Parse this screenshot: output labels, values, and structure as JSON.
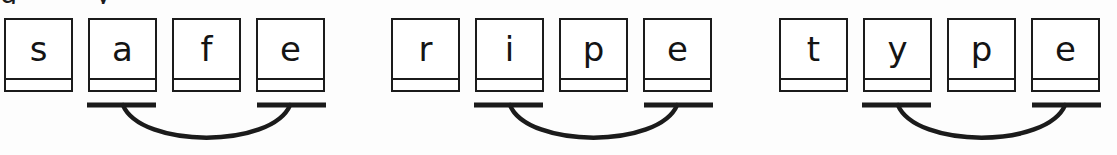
{
  "page": {
    "width": 1117,
    "height": 155,
    "ink_color": "#1b1b1b",
    "paper_color": "#fdfdfd",
    "cutoff_text_above": "g    y"
  },
  "words": [
    {
      "word": "safe",
      "x": 4,
      "letters": [
        {
          "char": "s",
          "x": 0,
          "marked": false
        },
        {
          "char": "a",
          "x": 84,
          "marked": true
        },
        {
          "char": "f",
          "x": 168,
          "marked": false
        },
        {
          "char": "e",
          "x": 252,
          "marked": true
        }
      ],
      "arc": {
        "start_x": 83,
        "end_x": 322,
        "bar_length": 69,
        "depth": 30
      }
    },
    {
      "word": "ripe",
      "x": 391,
      "letters": [
        {
          "char": "r",
          "x": 0,
          "marked": false
        },
        {
          "char": "i",
          "x": 84,
          "marked": true
        },
        {
          "char": "p",
          "x": 168,
          "marked": false
        },
        {
          "char": "e",
          "x": 252,
          "marked": true
        }
      ],
      "arc": {
        "start_x": 83,
        "end_x": 322,
        "bar_length": 69,
        "depth": 30
      }
    },
    {
      "word": "type",
      "x": 779,
      "letters": [
        {
          "char": "t",
          "x": 0,
          "marked": false
        },
        {
          "char": "y",
          "x": 84,
          "marked": true
        },
        {
          "char": "p",
          "x": 168,
          "marked": false
        },
        {
          "char": "e",
          "x": 252,
          "marked": true
        }
      ],
      "arc": {
        "start_x": 83,
        "end_x": 322,
        "bar_length": 69,
        "depth": 30
      }
    }
  ]
}
